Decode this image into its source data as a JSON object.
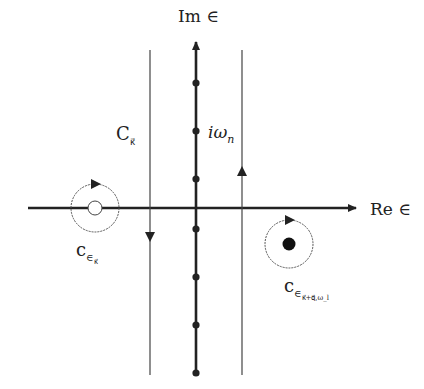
{
  "diagram": {
    "type": "complex-plane-contour",
    "axes": {
      "imaginary_label": "Im ∈",
      "real_label": "Re ∈"
    },
    "matsubara_label": {
      "base": "iω",
      "sub": "n"
    },
    "contours": {
      "main_contour": {
        "base": "C",
        "sub": "κ⃗"
      },
      "small_contour_left": {
        "base": "c",
        "sub": "∈",
        "subsub": "κ⃗"
      },
      "small_contour_right": {
        "base": "c",
        "sub": "∈",
        "subsub": "κ⃗+q⃗,ω_l"
      }
    },
    "poles": {
      "imaginary_axis_dots": 7,
      "left_pole": "open circle",
      "right_pole": "filled circle"
    },
    "colors": {
      "ink": "#222222",
      "contour": "#555555",
      "background": "#ffffff"
    }
  }
}
